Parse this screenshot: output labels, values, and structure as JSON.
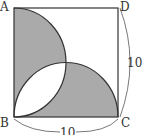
{
  "diagram": {
    "type": "geometry",
    "vertices": {
      "A": "A",
      "B": "B",
      "C": "C",
      "D": "D"
    },
    "dimensions": {
      "right_side": "10",
      "bottom_side": "10"
    },
    "colors": {
      "shade": "#aaaaaa",
      "stroke": "#333333",
      "background": "#ffffff"
    }
  }
}
